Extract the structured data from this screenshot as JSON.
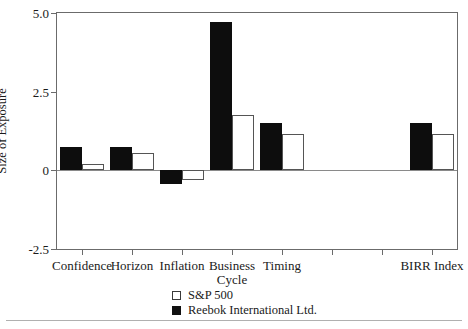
{
  "chart_data": {
    "type": "bar",
    "title": "",
    "xlabel": "",
    "ylabel": "Size of Exposure",
    "ylim": [
      -2.5,
      5.0
    ],
    "yticks": [
      "5.0",
      "2.5",
      "0",
      "-2.5"
    ],
    "ytick_values": [
      5.0,
      2.5,
      0,
      -2.5
    ],
    "grid": false,
    "legend_position": "bottom-center",
    "categories": [
      "Confidence",
      "Horizon",
      "Inflation",
      "Business Cycle",
      "Timing",
      "BIRR Index"
    ],
    "category_lines": [
      [
        "Confidence"
      ],
      [
        "Horizon"
      ],
      [
        "Inflation"
      ],
      [
        "Business",
        "Cycle"
      ],
      [
        "Timing"
      ],
      [
        "BIRR Index"
      ]
    ],
    "series": [
      {
        "name": "S&P 500",
        "color": "#ffffff",
        "edge_color": "#555555",
        "values": [
          0.2,
          0.55,
          -0.3,
          1.75,
          1.15,
          1.15
        ]
      },
      {
        "name": "Reebok International Ltd.",
        "color": "#0d0d0d",
        "edge_color": "#0d0d0d",
        "values": [
          0.75,
          0.75,
          -0.45,
          4.7,
          1.5,
          1.5
        ]
      }
    ]
  },
  "legend": {
    "items": [
      {
        "label": "S&P 500",
        "swatch": "open-square-swatch"
      },
      {
        "label": "Reebok International Ltd.",
        "swatch": "filled-square-swatch"
      }
    ]
  },
  "axis": {
    "y_title": "Size of Exposure",
    "y_labels": [
      "5.0",
      "2.5",
      "0",
      "-2.5"
    ],
    "x_labels": [
      "Confidence",
      "Horizon",
      "Inflation",
      "Business",
      "Cycle",
      "Timing",
      "BIRR Index"
    ]
  }
}
